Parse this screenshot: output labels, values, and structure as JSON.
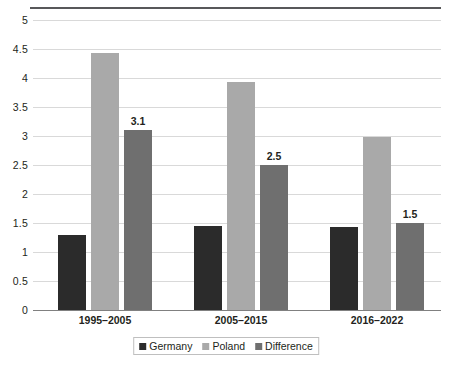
{
  "chart_data": {
    "type": "bar",
    "title": "",
    "xlabel": "",
    "ylabel": "",
    "categories": [
      "1995–2005",
      "2005–2015",
      "2016–2022"
    ],
    "series": [
      {
        "name": "Germany",
        "color": "#2b2b2b",
        "values": [
          1.3,
          1.45,
          1.43
        ],
        "data_labels": [
          "",
          "",
          ""
        ]
      },
      {
        "name": "Poland",
        "color": "#a9a9a9",
        "values": [
          4.43,
          3.93,
          2.98
        ],
        "data_labels": [
          "",
          "",
          ""
        ]
      },
      {
        "name": "Difference",
        "color": "#6f6f6f",
        "values": [
          3.1,
          2.5,
          1.5
        ],
        "data_labels": [
          "3.1",
          "2.5",
          "1.5"
        ]
      }
    ],
    "ylim": [
      0,
      5
    ],
    "ytick_step": 0.5,
    "yticks": [
      "0",
      "0.5",
      "1",
      "1.5",
      "2",
      "2.5",
      "3",
      "3.5",
      "4",
      "4.5",
      "5"
    ],
    "grid": true,
    "legend_position": "bottom"
  },
  "legend": {
    "items": [
      {
        "label": "Germany"
      },
      {
        "label": "Poland"
      },
      {
        "label": "Difference"
      }
    ]
  }
}
